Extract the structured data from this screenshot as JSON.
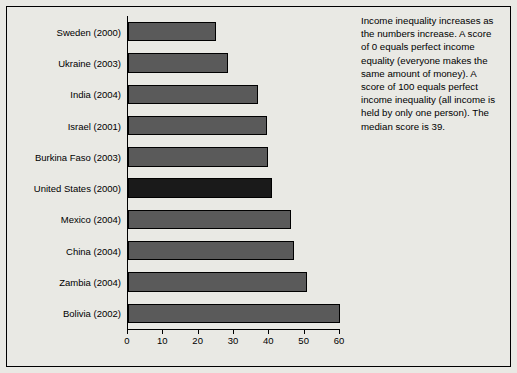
{
  "chart_data": {
    "type": "bar",
    "orientation": "horizontal",
    "title": "",
    "subtitle": "",
    "xlabel": "",
    "ylabel": "",
    "xlim": [
      0,
      60
    ],
    "xticks": [
      0,
      10,
      20,
      30,
      40,
      50,
      60
    ],
    "grid": false,
    "legend": null,
    "categories": [
      "Sweden (2000)",
      "Ukraine (2003)",
      "India (2004)",
      "Israel (2001)",
      "Burkina Faso (2003)",
      "United States (2000)",
      "Mexico (2004)",
      "China (2004)",
      "Zambia (2004)",
      "Bolivia (2002)"
    ],
    "values": [
      25,
      28.2,
      36.8,
      39.2,
      39.5,
      40.8,
      46.1,
      46.9,
      50.8,
      60.1
    ],
    "highlight_category": "United States (2000)",
    "colors": {
      "bar": "#5a5a5a",
      "bar_highlight": "#1a1a1a",
      "bar_border": "#000000",
      "background": "#e9e9e4",
      "axis": "#000000",
      "text": "#000000"
    }
  },
  "annotation": {
    "text": "Income inequality increases as the numbers increase. A score of 0 equals perfect income equality (everyone makes the same amount of money). A score of 100 equals perfect income inequality (all income is held by only one person). The median score is 39."
  }
}
